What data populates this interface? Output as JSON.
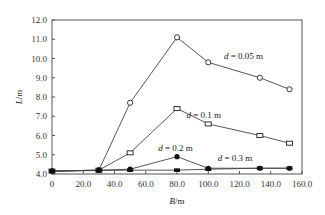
{
  "chart_data": {
    "type": "line",
    "title": "",
    "xlabel": "B/m",
    "ylabel": "L/m",
    "xlim": [
      0,
      160
    ],
    "ylim": [
      4.0,
      12.0
    ],
    "xticks": [
      "0",
      "20.0",
      "40.0",
      "60.0",
      "80.0",
      "100.0",
      "120.0",
      "140.0",
      "160.0"
    ],
    "yticks": [
      "4.0",
      "5.0",
      "6.0",
      "7.0",
      "8.0",
      "9.0",
      "10.0",
      "11.0",
      "12.0"
    ],
    "grid": false,
    "series": [
      {
        "name": "d = 0.05 m",
        "marker": "open-circle",
        "x": [
          0,
          30,
          50,
          80,
          100,
          133,
          152
        ],
        "y": [
          4.15,
          4.2,
          7.7,
          11.1,
          9.8,
          9.0,
          8.4
        ]
      },
      {
        "name": "d = 0.1 m",
        "marker": "open-square",
        "x": [
          0,
          30,
          50,
          80,
          100,
          133,
          152
        ],
        "y": [
          4.15,
          4.2,
          5.1,
          7.4,
          6.6,
          6.0,
          5.6
        ]
      },
      {
        "name": "d = 0.2 m",
        "marker": "filled-circle",
        "x": [
          0,
          30,
          50,
          80,
          100,
          133,
          152
        ],
        "y": [
          4.15,
          4.2,
          4.25,
          4.9,
          4.3,
          4.3,
          4.3
        ]
      },
      {
        "name": "d = 0.3 m",
        "marker": "filled-square",
        "x": [
          0,
          30,
          50,
          80,
          100,
          133,
          152
        ],
        "y": [
          4.15,
          4.18,
          4.2,
          4.2,
          4.25,
          4.3,
          4.3
        ]
      }
    ],
    "annotations": [
      {
        "text": "d = 0.05 m",
        "x": 110,
        "y": 10.0
      },
      {
        "text": "d = 0.1 m",
        "x": 86,
        "y": 6.9
      },
      {
        "text": "d = 0.2 m",
        "x": 68,
        "y": 5.2
      },
      {
        "text": "d = 0.3 m",
        "x": 106,
        "y": 4.7
      }
    ]
  }
}
